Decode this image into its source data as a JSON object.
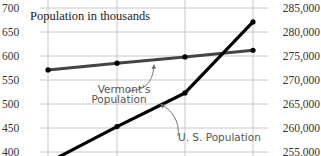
{
  "chart_data": {
    "type": "line",
    "title": "Population in thousands",
    "x": [
      "t1",
      "t2",
      "t3",
      "t4"
    ],
    "xlabel": "",
    "left_axis": {
      "label": "Population in thousands",
      "ticks": [
        700,
        650,
        600,
        550,
        500,
        450,
        400
      ],
      "range": [
        390,
        705
      ]
    },
    "right_axis": {
      "ticks": [
        "285,000",
        "280,000",
        "275,000",
        "270,000",
        "265,000",
        "260,000",
        "255,000"
      ],
      "range": [
        253000,
        286000
      ]
    },
    "series": [
      {
        "name": "Vermont's Population",
        "axis": "left",
        "color": "#444444",
        "values": [
          571,
          585,
          598,
          612
        ]
      },
      {
        "name": "U. S. Population",
        "axis": "right",
        "color": "#000000",
        "values": [
          252800,
          260300,
          267300,
          282100
        ]
      }
    ],
    "annotations": [
      {
        "text_lines": [
          "Vermont's",
          "Population"
        ],
        "points_to": "Vermont's Population"
      },
      {
        "text_lines": [
          "U. S. Population"
        ],
        "points_to": "U. S. Population"
      }
    ],
    "grid": true,
    "legend": "none (inline annotations)"
  },
  "labels": {
    "title": "Population in thousands",
    "vermont_line1": "Vermont's",
    "vermont_line2": "Population",
    "us": "U. S. Population",
    "left_ticks": [
      "700",
      "650",
      "600",
      "550",
      "500",
      "450",
      "400"
    ],
    "right_ticks": [
      "285,000",
      "280,000",
      "275,000",
      "270,000",
      "265,000",
      "260,000",
      "255,000"
    ]
  },
  "colors": {
    "grid": "#c8c8c8",
    "vermont": "#444444",
    "us": "#000000",
    "annotation": "#666666"
  }
}
